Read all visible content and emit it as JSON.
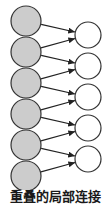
{
  "figure": {
    "caption": "重叠的局部连接",
    "canvas": {
      "width": 110,
      "height": 214
    },
    "colors": {
      "input_node_fill": "#cccccc",
      "output_node_fill": "#ffffff",
      "node_stroke": "#333333",
      "edge_stroke": "#222222",
      "caption_color": "#1a1a1a",
      "background": "#ffffff"
    },
    "layers": [
      {
        "name": "input-layer",
        "role": "input",
        "count": 6,
        "fill": "#cccccc",
        "radius": 15,
        "cx": 26,
        "nodes": [
          {
            "id": "L1",
            "cy": 21
          },
          {
            "id": "L2",
            "cy": 52
          },
          {
            "id": "L3",
            "cy": 83
          },
          {
            "id": "L4",
            "cy": 114
          },
          {
            "id": "L5",
            "cy": 145
          },
          {
            "id": "L6",
            "cy": 176
          }
        ]
      },
      {
        "name": "output-layer",
        "role": "output",
        "count": 5,
        "fill": "#ffffff",
        "radius": 13,
        "cx": 88,
        "nodes": [
          {
            "id": "R1",
            "cy": 35
          },
          {
            "id": "R2",
            "cy": 66
          },
          {
            "id": "R3",
            "cy": 97
          },
          {
            "id": "R4",
            "cy": 128
          },
          {
            "id": "R5",
            "cy": 159
          }
        ]
      }
    ],
    "edges": [
      {
        "from": "L1",
        "to": "R1"
      },
      {
        "from": "L2",
        "to": "R1"
      },
      {
        "from": "L2",
        "to": "R2"
      },
      {
        "from": "L3",
        "to": "R2"
      },
      {
        "from": "L3",
        "to": "R3"
      },
      {
        "from": "L4",
        "to": "R3"
      },
      {
        "from": "L4",
        "to": "R4"
      },
      {
        "from": "L5",
        "to": "R4"
      },
      {
        "from": "L5",
        "to": "R5"
      },
      {
        "from": "L6",
        "to": "R5"
      }
    ]
  }
}
